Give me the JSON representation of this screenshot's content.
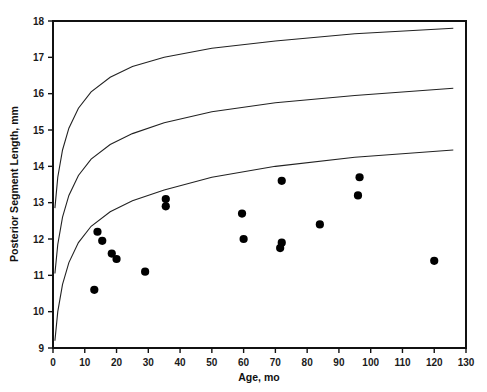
{
  "chart_data": {
    "type": "scatter",
    "title": "",
    "xlabel": "Age, mo",
    "ylabel": "Posterior Segment Length, mm",
    "xlim": [
      0,
      130
    ],
    "ylim": [
      9,
      18
    ],
    "xticks": [
      0,
      10,
      20,
      30,
      40,
      50,
      60,
      70,
      80,
      90,
      100,
      110,
      120,
      130
    ],
    "yticks": [
      9,
      10,
      11,
      12,
      13,
      14,
      15,
      16,
      17,
      18
    ],
    "xtick_labels": [
      "0",
      "10",
      "20",
      "30",
      "40",
      "50",
      "60",
      "70",
      "80",
      "90",
      "100",
      "110",
      "120",
      "130"
    ],
    "ytick_labels": [
      "9",
      "10",
      "11",
      "12",
      "13",
      "14",
      "15",
      "16",
      "17",
      "18"
    ],
    "grid": false,
    "legend": "none",
    "series": [
      {
        "name": "Patient measurements",
        "type": "scatter",
        "marker": "filled-circle",
        "color": "#000000",
        "points": [
          {
            "x": 13,
            "y": 10.6
          },
          {
            "x": 14,
            "y": 12.2
          },
          {
            "x": 15.5,
            "y": 11.95
          },
          {
            "x": 18.5,
            "y": 11.6
          },
          {
            "x": 20,
            "y": 11.45
          },
          {
            "x": 29,
            "y": 11.1
          },
          {
            "x": 35.5,
            "y": 13.1
          },
          {
            "x": 35.5,
            "y": 12.9
          },
          {
            "x": 59.5,
            "y": 12.7
          },
          {
            "x": 60,
            "y": 12.0
          },
          {
            "x": 72,
            "y": 13.6
          },
          {
            "x": 72,
            "y": 11.9
          },
          {
            "x": 71.5,
            "y": 11.75
          },
          {
            "x": 84,
            "y": 12.4
          },
          {
            "x": 96.5,
            "y": 13.7
          },
          {
            "x": 96,
            "y": 13.2
          },
          {
            "x": 120,
            "y": 11.4
          }
        ]
      },
      {
        "name": "Upper percentile curve",
        "type": "line",
        "color": "#222222",
        "points": [
          {
            "x": 0.6,
            "y": 12.85
          },
          {
            "x": 1.5,
            "y": 13.7
          },
          {
            "x": 3,
            "y": 14.45
          },
          {
            "x": 5,
            "y": 15.05
          },
          {
            "x": 8,
            "y": 15.6
          },
          {
            "x": 12,
            "y": 16.05
          },
          {
            "x": 18,
            "y": 16.45
          },
          {
            "x": 25,
            "y": 16.75
          },
          {
            "x": 35,
            "y": 17.0
          },
          {
            "x": 50,
            "y": 17.25
          },
          {
            "x": 70,
            "y": 17.45
          },
          {
            "x": 95,
            "y": 17.65
          },
          {
            "x": 126,
            "y": 17.8
          }
        ]
      },
      {
        "name": "Middle percentile curve",
        "type": "line",
        "color": "#222222",
        "points": [
          {
            "x": 0.6,
            "y": 11.05
          },
          {
            "x": 1.5,
            "y": 11.85
          },
          {
            "x": 3,
            "y": 12.6
          },
          {
            "x": 5,
            "y": 13.2
          },
          {
            "x": 8,
            "y": 13.75
          },
          {
            "x": 12,
            "y": 14.2
          },
          {
            "x": 18,
            "y": 14.6
          },
          {
            "x": 25,
            "y": 14.9
          },
          {
            "x": 35,
            "y": 15.2
          },
          {
            "x": 50,
            "y": 15.5
          },
          {
            "x": 70,
            "y": 15.75
          },
          {
            "x": 95,
            "y": 15.95
          },
          {
            "x": 126,
            "y": 16.15
          }
        ]
      },
      {
        "name": "Lower percentile curve",
        "type": "line",
        "color": "#222222",
        "points": [
          {
            "x": 0.6,
            "y": 9.2
          },
          {
            "x": 1.5,
            "y": 10.0
          },
          {
            "x": 3,
            "y": 10.75
          },
          {
            "x": 5,
            "y": 11.35
          },
          {
            "x": 8,
            "y": 11.9
          },
          {
            "x": 12,
            "y": 12.35
          },
          {
            "x": 18,
            "y": 12.75
          },
          {
            "x": 25,
            "y": 13.05
          },
          {
            "x": 35,
            "y": 13.35
          },
          {
            "x": 50,
            "y": 13.7
          },
          {
            "x": 70,
            "y": 14.0
          },
          {
            "x": 95,
            "y": 14.25
          },
          {
            "x": 126,
            "y": 14.45
          }
        ]
      }
    ]
  }
}
